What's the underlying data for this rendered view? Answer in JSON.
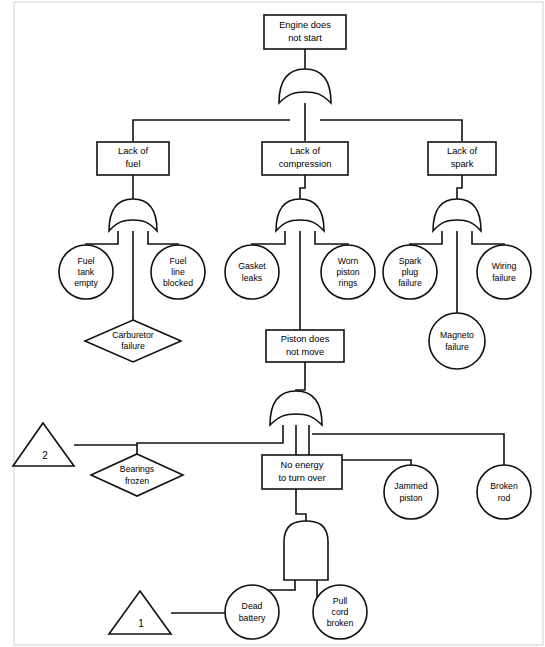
{
  "diagram": {
    "type": "fault-tree",
    "canvas": {
      "width": 545,
      "height": 647
    },
    "colors": {
      "stroke": "#111111",
      "fill": "#ffffff",
      "frame": "#cfcfcf"
    },
    "nodes": [
      {
        "id": "top",
        "kind": "rect",
        "label": "Engine does\nnot start",
        "x": 305,
        "y": 32,
        "w": 82,
        "h": 34
      },
      {
        "id": "lack_fuel",
        "kind": "rect",
        "label": "Lack of\nfuel",
        "x": 133,
        "y": 158,
        "w": 72,
        "h": 33
      },
      {
        "id": "lack_compr",
        "kind": "rect",
        "label": "Lack of\ncompression",
        "x": 305,
        "y": 158,
        "w": 85,
        "h": 33
      },
      {
        "id": "lack_spark",
        "kind": "rect",
        "label": "Lack of\nspark",
        "x": 462,
        "y": 158,
        "w": 68,
        "h": 33
      },
      {
        "id": "fuel_tank",
        "kind": "circle",
        "label": "Fuel\ntank\nempty",
        "x": 86,
        "y": 272,
        "r": 27
      },
      {
        "id": "fuel_line",
        "kind": "circle",
        "label": "Fuel\nline\nblocked",
        "x": 178,
        "y": 272,
        "r": 27
      },
      {
        "id": "carburetor",
        "kind": "diamond",
        "label": "Carburetor\nfailure",
        "x": 133,
        "y": 341,
        "w": 96,
        "h": 42
      },
      {
        "id": "gasket",
        "kind": "circle",
        "label": "Gasket\nleaks",
        "x": 252,
        "y": 272,
        "r": 27
      },
      {
        "id": "worn_piston",
        "kind": "circle",
        "label": "Worn\npiston\nrings",
        "x": 348,
        "y": 272,
        "r": 27
      },
      {
        "id": "spark_plug",
        "kind": "circle",
        "label": "Spark\nplug\nfailure",
        "x": 410,
        "y": 272,
        "r": 27
      },
      {
        "id": "wiring",
        "kind": "circle",
        "label": "Wiring\nfailure",
        "x": 504,
        "y": 272,
        "r": 27
      },
      {
        "id": "magneto",
        "kind": "circle",
        "label": "Magneto\nfailure",
        "x": 457,
        "y": 341,
        "r": 28
      },
      {
        "id": "piston_move",
        "kind": "rect",
        "label": "Piston does\nnot move",
        "x": 305,
        "y": 346,
        "w": 78,
        "h": 32
      },
      {
        "id": "transfer2",
        "kind": "triangle",
        "label": "2",
        "x": 43,
        "y": 445,
        "w": 60,
        "h": 44
      },
      {
        "id": "bearings",
        "kind": "diamond",
        "label": "Bearings\nfrozen",
        "x": 137,
        "y": 475,
        "w": 92,
        "h": 42
      },
      {
        "id": "no_energy",
        "kind": "rect",
        "label": "No energy\nto turn over",
        "x": 296,
        "y": 472,
        "w": 76,
        "h": 33
      },
      {
        "id": "jammed",
        "kind": "circle",
        "label": "Jammed\npiston",
        "x": 411,
        "y": 492,
        "r": 27
      },
      {
        "id": "broken_rod",
        "kind": "circle",
        "label": "Broken\nrod",
        "x": 504,
        "y": 492,
        "r": 27
      },
      {
        "id": "transfer1",
        "kind": "triangle",
        "label": "1",
        "x": 140,
        "y": 613,
        "w": 62,
        "h": 44
      },
      {
        "id": "dead_battery",
        "kind": "circle",
        "label": "Dead\nbattery",
        "x": 252,
        "y": 612,
        "r": 27
      },
      {
        "id": "pull_cord",
        "kind": "circle",
        "label": "Pull\ncord\nbroken",
        "x": 340,
        "y": 612,
        "r": 27
      }
    ],
    "gates": [
      {
        "id": "g_top",
        "kind": "or",
        "x": 305,
        "y": 86,
        "w": 52,
        "h": 34,
        "inputs": 3,
        "parent": "top"
      },
      {
        "id": "g_fuel",
        "kind": "or",
        "x": 133,
        "y": 215,
        "w": 48,
        "h": 32,
        "inputs": 3,
        "parent": "lack_fuel"
      },
      {
        "id": "g_compr",
        "kind": "or",
        "x": 300,
        "y": 215,
        "w": 48,
        "h": 32,
        "inputs": 3,
        "parent": "lack_compr"
      },
      {
        "id": "g_spark",
        "kind": "or",
        "x": 457,
        "y": 215,
        "w": 48,
        "h": 32,
        "inputs": 3,
        "parent": "lack_spark"
      },
      {
        "id": "g_piston",
        "kind": "or",
        "x": 296,
        "y": 408,
        "w": 52,
        "h": 34,
        "inputs": 4,
        "parent": "piston_move"
      },
      {
        "id": "g_energy",
        "kind": "and",
        "x": 284,
        "y": 538,
        "w": 44,
        "h": 42,
        "inputs": 2,
        "parent": "no_energy"
      }
    ],
    "labels": {
      "top_event": "Engine does not start",
      "transfer_in_1": "1",
      "transfer_in_2": "2"
    }
  }
}
